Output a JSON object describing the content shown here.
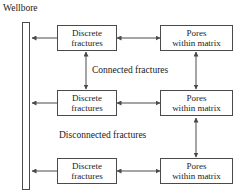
{
  "diagram": {
    "title_label": "Wellbore",
    "background_color": "#ffffff",
    "line_color": "#4a4a4a",
    "text_color": "#1a1a1a",
    "wellbore": {
      "name": "Wellbore",
      "label": "Wellbore"
    },
    "rows": [
      {
        "id": "row-top",
        "left_node": {
          "line1": "Discrete",
          "line2": "fractures"
        },
        "right_node": {
          "line1": "Pores",
          "line2": "within matrix"
        }
      },
      {
        "id": "row-middle",
        "left_node": {
          "line1": "Discrete",
          "line2": "fractures"
        },
        "right_node": {
          "line1": "Pores",
          "line2": "within matrix"
        }
      },
      {
        "id": "row-bottom",
        "left_node": {
          "line1": "Discrete",
          "line2": "fractures"
        },
        "right_node": {
          "line1": "Pores",
          "line2": "within matrix"
        }
      }
    ],
    "edge_labels": [
      {
        "id": "connected",
        "text": "Connected fractures"
      },
      {
        "id": "disconnected",
        "text": "Disconnected fractures"
      }
    ]
  }
}
